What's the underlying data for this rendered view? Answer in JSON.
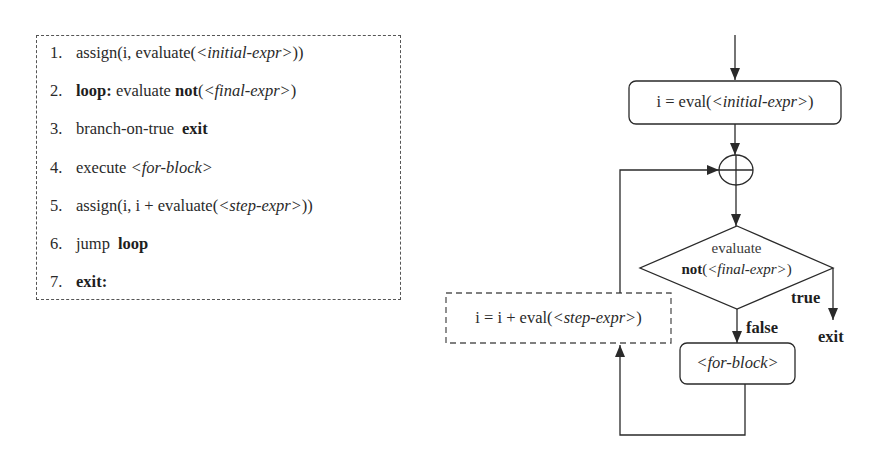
{
  "pseudocode": {
    "lines": [
      {
        "num": "1.",
        "parts": [
          {
            "text": "assign(i, evaluate(",
            "style": "normal"
          },
          {
            "text": "<initial-expr>",
            "style": "italic"
          },
          {
            "text": "))",
            "style": "normal"
          }
        ]
      },
      {
        "num": "2.",
        "parts": [
          {
            "text": "loop:",
            "style": "bold"
          },
          {
            "text": " evaluate ",
            "style": "normal"
          },
          {
            "text": "not",
            "style": "bold"
          },
          {
            "text": "(",
            "style": "normal"
          },
          {
            "text": "<final-expr>",
            "style": "italic"
          },
          {
            "text": ")",
            "style": "normal"
          }
        ]
      },
      {
        "num": "3.",
        "parts": [
          {
            "text": "branch-on-true",
            "style": "normal"
          },
          {
            "text": "exit",
            "style": "bold"
          }
        ]
      },
      {
        "num": "4.",
        "parts": [
          {
            "text": "execute ",
            "style": "normal"
          },
          {
            "text": "<for-block>",
            "style": "italic"
          }
        ]
      },
      {
        "num": "5.",
        "parts": [
          {
            "text": "assign(i, i + evaluate(",
            "style": "normal"
          },
          {
            "text": "<step-expr>",
            "style": "italic"
          },
          {
            "text": "))",
            "style": "normal"
          }
        ]
      },
      {
        "num": "6.",
        "parts": [
          {
            "text": "jump",
            "style": "normal"
          },
          {
            "text": "loop",
            "style": "bold"
          }
        ]
      },
      {
        "num": "7.",
        "parts": [
          {
            "text": "exit:",
            "style": "bold"
          }
        ]
      }
    ]
  },
  "flowchart": {
    "init_node": {
      "prefix": "i = eval(",
      "italic": "<initial-expr>",
      "suffix": ")"
    },
    "junction": "plus-circle",
    "decision": {
      "line1": "evaluate",
      "bold": "not",
      "open": "(",
      "italic": "<final-expr>",
      "close": ")"
    },
    "edge_true": "true",
    "edge_false": "false",
    "exit_label": "exit",
    "body_node": {
      "italic": "<for-block>"
    },
    "step_node": {
      "prefix": "i = i + eval(",
      "italic": "<step-expr>",
      "suffix": ")"
    }
  },
  "colors": {
    "stroke": "#2a2a2a",
    "dash": "#555555",
    "background": "#ffffff"
  }
}
